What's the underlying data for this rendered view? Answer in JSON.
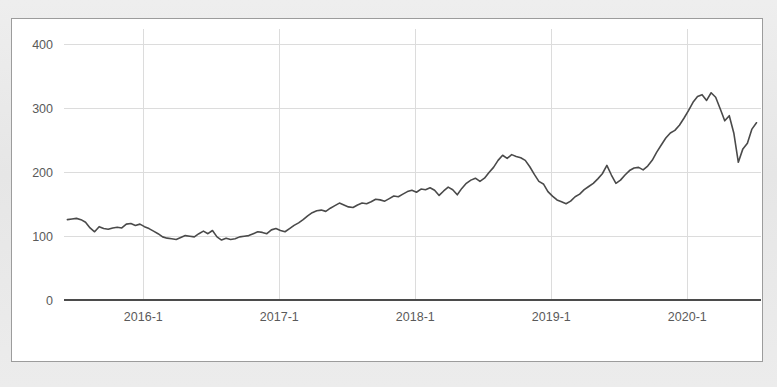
{
  "panel": {
    "background_color": "#ffffff",
    "border_color": "#9c9c9c",
    "outer_background_color": "#e9e9e9"
  },
  "chart_data": {
    "type": "line",
    "title": "",
    "subtitle": "",
    "xlabel": "",
    "ylabel": "",
    "grid": true,
    "legend": false,
    "legend_position": "none",
    "series_color": "#4a4a4a",
    "grid_color": "#dcdcdc",
    "axis_color": "#4b4b4b",
    "tick_label_color": "#5a5a5a",
    "ylim": [
      0,
      425
    ],
    "yticks": [
      0,
      100,
      200,
      300,
      400
    ],
    "ytick_labels": [
      "0",
      "100",
      "200",
      "300",
      "400"
    ],
    "xticks": [
      12.0,
      24.0,
      36.0,
      48.0,
      60.0
    ],
    "xtick_labels": [
      "2016-1",
      "2017-1",
      "2018-1",
      "2019-1",
      "2020-1"
    ],
    "xlim": [
      5.0,
      66.5
    ],
    "x_unit": "months since 2015-01",
    "series": [
      {
        "name": "price",
        "x": [
          5.3,
          5.7,
          6.1,
          6.5,
          6.9,
          7.3,
          7.7,
          8.1,
          8.5,
          8.9,
          9.3,
          9.7,
          10.1,
          10.5,
          10.9,
          11.3,
          11.7,
          12.1,
          12.5,
          12.9,
          13.3,
          13.7,
          14.1,
          14.5,
          14.9,
          15.3,
          15.7,
          16.1,
          16.5,
          16.9,
          17.3,
          17.7,
          18.1,
          18.5,
          18.9,
          19.3,
          19.7,
          20.1,
          20.5,
          20.9,
          21.3,
          21.7,
          22.1,
          22.5,
          22.9,
          23.3,
          23.7,
          24.1,
          24.5,
          24.9,
          25.3,
          25.7,
          26.1,
          26.5,
          26.9,
          27.3,
          27.7,
          28.1,
          28.5,
          28.9,
          29.3,
          29.7,
          30.1,
          30.5,
          30.9,
          31.3,
          31.7,
          32.1,
          32.5,
          32.9,
          33.3,
          33.7,
          34.1,
          34.5,
          34.9,
          35.3,
          35.7,
          36.1,
          36.5,
          36.9,
          37.3,
          37.7,
          38.1,
          38.5,
          38.9,
          39.3,
          39.7,
          40.1,
          40.5,
          40.9,
          41.3,
          41.7,
          42.1,
          42.5,
          42.9,
          43.3,
          43.7,
          44.1,
          44.5,
          44.9,
          45.3,
          45.7,
          46.1,
          46.5,
          46.9,
          47.3,
          47.7,
          48.1,
          48.5,
          48.9,
          49.3,
          49.7,
          50.1,
          50.5,
          50.9,
          51.3,
          51.7,
          52.1,
          52.5,
          52.9,
          53.3,
          53.7,
          54.1,
          54.5,
          54.9,
          55.3,
          55.7,
          56.1,
          56.5,
          56.9,
          57.3,
          57.7,
          58.1,
          58.5,
          58.9,
          59.3,
          59.7,
          60.1,
          60.5,
          60.9,
          61.3,
          61.7,
          62.1,
          62.5,
          62.9,
          63.3,
          63.7,
          64.1,
          64.5,
          64.9,
          65.3,
          65.7,
          66.1
        ],
        "values": [
          126,
          127,
          128,
          126,
          122,
          113,
          107,
          115,
          112,
          111,
          113,
          114,
          113,
          119,
          120,
          117,
          119,
          115,
          112,
          108,
          104,
          99,
          97,
          96,
          95,
          98,
          101,
          100,
          99,
          104,
          108,
          104,
          109,
          99,
          94,
          97,
          95,
          96,
          99,
          100,
          101,
          104,
          107,
          106,
          104,
          110,
          112,
          109,
          107,
          112,
          117,
          121,
          126,
          132,
          137,
          140,
          141,
          139,
          144,
          148,
          152,
          149,
          146,
          145,
          149,
          152,
          151,
          154,
          158,
          157,
          155,
          159,
          163,
          162,
          166,
          170,
          172,
          169,
          174,
          173,
          176,
          172,
          164,
          171,
          177,
          173,
          165,
          175,
          183,
          188,
          191,
          186,
          191,
          200,
          208,
          219,
          227,
          222,
          228,
          225,
          223,
          219,
          209,
          197,
          186,
          182,
          170,
          163,
          157,
          154,
          151,
          155,
          162,
          166,
          173,
          178,
          183,
          190,
          198,
          211,
          196,
          183,
          188,
          196,
          203,
          207,
          208,
          204,
          210,
          219,
          232,
          243,
          254,
          262,
          266,
          274,
          285,
          297,
          310,
          319,
          322,
          313,
          325,
          318,
          300,
          281,
          289,
          262,
          216,
          237,
          246,
          268,
          278
        ]
      }
    ],
    "annotations": []
  }
}
